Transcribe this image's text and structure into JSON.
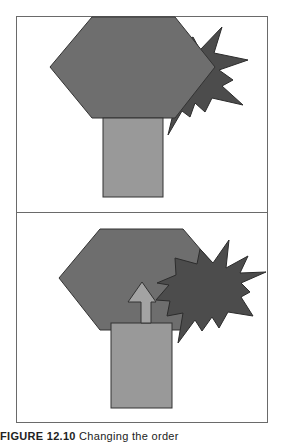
{
  "figure": {
    "caption_label": "FIGURE 12.10",
    "caption_text": "Changing the order"
  },
  "colors": {
    "hexagon": "#6e6e6e",
    "starburst": "#4c4c4c",
    "rectangle": "#999999",
    "arrow": "#a3a3a3",
    "outline": "#333333",
    "frame": "#6a6a6a"
  },
  "panels": [
    {
      "id": "top",
      "description": "Hexagon in front of starburst, rectangle below"
    },
    {
      "id": "bottom",
      "description": "Starburst brought to front, rectangle with up-arrow"
    }
  ]
}
